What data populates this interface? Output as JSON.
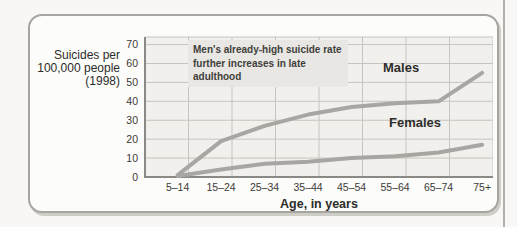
{
  "page": {
    "background_color": "#f8f7f5",
    "right_rule_color": "#b1afaa",
    "card_border_color": "#a7a5a0"
  },
  "figure": {
    "y_axis_label_lines": [
      "Suicides per",
      "100,000 people",
      "(1998)"
    ]
  },
  "chart_data": {
    "type": "line",
    "categories": [
      "5–14",
      "15–24",
      "25–34",
      "35–44",
      "45–54",
      "55–64",
      "65–74",
      "75+"
    ],
    "series": [
      {
        "name": "Males",
        "values": [
          1,
          19,
          27,
          33,
          37,
          39,
          40,
          55
        ]
      },
      {
        "name": "Females",
        "values": [
          0.5,
          4,
          7,
          8,
          10,
          11,
          13,
          17
        ]
      }
    ],
    "xlabel": "Age, in years",
    "ylabel": "Suicides per 100,000 people (1998)",
    "yticks": [
      0,
      10,
      20,
      30,
      40,
      50,
      60,
      70
    ],
    "ylim": [
      0,
      74
    ],
    "grid": true,
    "legend": "inline-labels",
    "annotation": "Men's already-high suicide rate further increases in late adulthood",
    "line_color": "#a8a6a2",
    "plot_bg_color": "#f1f0ed",
    "gridline_color": "#c6c4c0",
    "axis_color": "#8b8985"
  }
}
